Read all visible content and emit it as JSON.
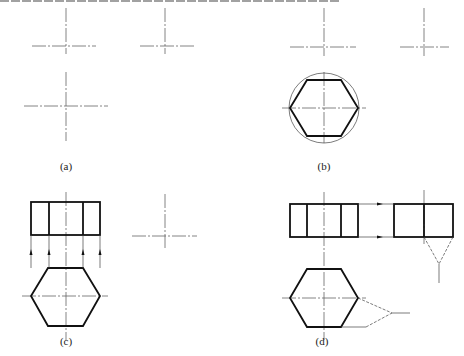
{
  "figure": {
    "colors": {
      "thick": "#111111",
      "thin": "#444444",
      "center": "#666666"
    },
    "panels": [
      {
        "id": "a",
        "label": "(a)",
        "label_pos": [
          66,
          168
        ]
      },
      {
        "id": "b",
        "label": "(b)",
        "label_pos": [
          324,
          168
        ]
      },
      {
        "id": "c",
        "label": "(c)",
        "label_pos": [
          66,
          343
        ]
      },
      {
        "id": "d",
        "label": "(d)",
        "label_pos": [
          322,
          343
        ]
      }
    ],
    "crosses": [
      {
        "panel": "a",
        "cx": 66,
        "cy": 46,
        "v": [
          8,
          54
        ],
        "h": [
          32,
          96
        ]
      },
      {
        "panel": "a",
        "cx": 165,
        "cy": 46,
        "v": [
          8,
          54
        ],
        "h": [
          140,
          195
        ]
      },
      {
        "panel": "a",
        "cx": 66,
        "cy": 106,
        "v": [
          72,
          141
        ],
        "h": [
          24,
          108
        ]
      },
      {
        "panel": "b",
        "cx": 324,
        "cy": 47,
        "v": [
          8,
          56
        ],
        "h": [
          290,
          356
        ]
      },
      {
        "panel": "b",
        "cx": 424,
        "cy": 47,
        "v": [
          8,
          56
        ],
        "h": [
          400,
          449
        ]
      },
      {
        "panel": "b",
        "cx": 324,
        "cy": 108,
        "v": [
          72,
          143
        ],
        "h": [
          282,
          366
        ]
      },
      {
        "panel": "c",
        "cx": 66,
        "cy": 296,
        "v": [
          192,
          340
        ],
        "h": [
          22,
          108
        ]
      },
      {
        "panel": "c",
        "cx": 165,
        "cy": 236,
        "v": [
          194,
          250
        ],
        "h": [
          132,
          197
        ]
      },
      {
        "panel": "d",
        "cx": 324,
        "cy": 298,
        "v": [
          192,
          340
        ],
        "h": [
          282,
          366
        ]
      },
      {
        "panel": "d",
        "cx": 424,
        "cy": 220,
        "v": [
          190,
          244
        ],
        "h": []
      }
    ],
    "circles": [
      {
        "panel": "b",
        "cx": 324,
        "cy": 108,
        "r": 35
      }
    ],
    "hexagons": [
      {
        "panel": "b",
        "points": [
          [
            290,
            108
          ],
          [
            307,
            80
          ],
          [
            341,
            80
          ],
          [
            358,
            108
          ],
          [
            341,
            136
          ],
          [
            307,
            136
          ]
        ]
      },
      {
        "panel": "c",
        "points": [
          [
            31,
            296
          ],
          [
            48,
            268
          ],
          [
            83,
            268
          ],
          [
            100,
            296
          ],
          [
            83,
            326
          ],
          [
            48,
            326
          ]
        ]
      },
      {
        "panel": "d",
        "points": [
          [
            290,
            298
          ],
          [
            307,
            269
          ],
          [
            341,
            269
          ],
          [
            358,
            298
          ],
          [
            341,
            327
          ],
          [
            307,
            327
          ]
        ]
      }
    ],
    "rectangles": [
      {
        "panel": "c",
        "x": 31,
        "y": 202,
        "w": 69,
        "h": 33,
        "dividers": [
          49,
          83
        ]
      },
      {
        "panel": "d",
        "x": 290,
        "y": 204,
        "w": 68,
        "h": 33,
        "dividers": [
          307,
          341
        ]
      },
      {
        "panel": "d",
        "x": 394,
        "y": 204,
        "w": 59,
        "h": 33,
        "dividers": [
          424
        ]
      }
    ],
    "projection_lines_c": {
      "xs": [
        31,
        49,
        83,
        100
      ],
      "y_from": 268,
      "y_to": 235,
      "arrow_y": 252
    },
    "projection_lines_d": {
      "ys": [
        204,
        237
      ],
      "x_from": 358,
      "x_to": 394,
      "arrow_x": 380
    },
    "miter_side": {
      "from": [
        [
          424,
          237
        ],
        [
          453,
          237
        ]
      ],
      "apex": [
        439,
        264
      ],
      "tail_to": [
        439,
        283
      ]
    },
    "miter_top": {
      "from": [
        [
          358,
          298
        ],
        [
          366,
          327
        ]
      ],
      "apex": [
        392,
        313
      ],
      "tail_to": [
        410,
        313
      ],
      "bottom_edge": [
        [
          341,
          327
        ],
        [
          366,
          327
        ]
      ]
    }
  }
}
